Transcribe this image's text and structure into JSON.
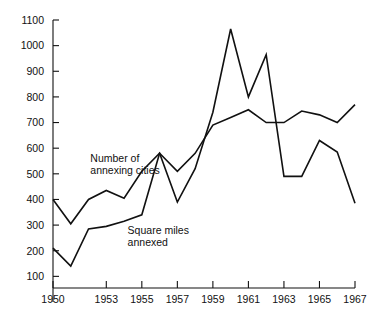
{
  "chart_data": {
    "type": "line",
    "title": "",
    "subtitle": "",
    "xlabel": "",
    "ylabel": "",
    "x": [
      1950,
      1951,
      1952,
      1953,
      1954,
      1955,
      1956,
      1957,
      1958,
      1959,
      1960,
      1961,
      1962,
      1963,
      1964,
      1965,
      1966,
      1967
    ],
    "xlim": [
      1950,
      1967
    ],
    "ylim": [
      0,
      1100
    ],
    "xticks": [
      1950,
      1953,
      1955,
      1957,
      1959,
      1961,
      1963,
      1965,
      1967
    ],
    "xtick_labels": [
      "1950",
      "1953",
      "1955",
      "1957",
      "1959",
      "1961",
      "1963",
      "1965",
      "1967"
    ],
    "yticks": [
      100,
      200,
      300,
      400,
      500,
      600,
      700,
      800,
      900,
      1000,
      1100
    ],
    "ytick_labels": [
      "100",
      "200",
      "300",
      "400",
      "500",
      "600",
      "700",
      "800",
      "900",
      "1000",
      "1100"
    ],
    "grid": false,
    "legend": "none",
    "series": [
      {
        "name": "Number of annexing cities",
        "color": "#111111",
        "values": [
          400,
          305,
          400,
          435,
          405,
          510,
          580,
          390,
          520,
          740,
          1065,
          800,
          965,
          490,
          490,
          630,
          585,
          385
        ]
      },
      {
        "name": "Square miles annexed",
        "color": "#111111",
        "values": [
          210,
          140,
          285,
          295,
          315,
          340,
          580,
          510,
          580,
          690,
          720,
          750,
          700,
          700,
          745,
          730,
          700,
          770
        ]
      }
    ],
    "annotations": [
      {
        "text_line1": "Number of",
        "text_line2": "annexing cities",
        "x": 1952.1,
        "y": 545,
        "for_series": 0
      },
      {
        "text_line1": "Square miles",
        "text_line2": "annexed",
        "x": 1954.2,
        "y": 265,
        "for_series": 1
      }
    ]
  }
}
